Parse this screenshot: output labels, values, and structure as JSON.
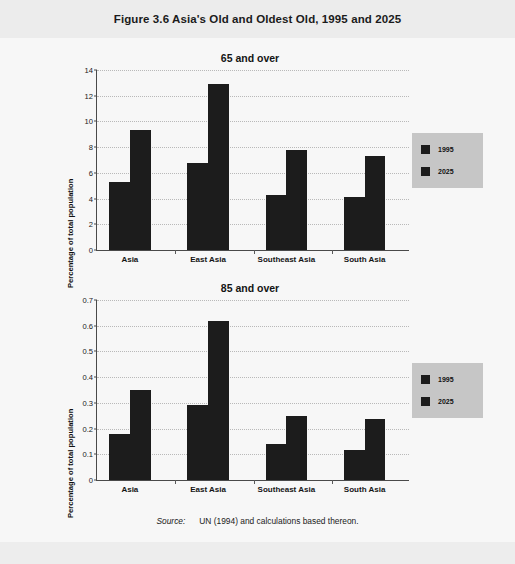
{
  "figure": {
    "title": "Figure 3.6  Asia's Old and Oldest Old, 1995 and 2025",
    "source_keyword": "Source:",
    "source_text": "UN (1994) and calculations based thereon."
  },
  "legend": {
    "series": [
      {
        "label": "1995",
        "color": "#1c1c1c"
      },
      {
        "label": "2025",
        "color": "#1c1c1c"
      }
    ],
    "background": "#c6c6c6"
  },
  "chart_data": [
    {
      "type": "bar",
      "title": "65 and over",
      "xlabel": "",
      "ylabel": "Percentage of total population",
      "categories": [
        "Asia",
        "East Asia",
        "Southeast Asia",
        "South Asia"
      ],
      "series": [
        {
          "name": "1995",
          "values": [
            5.3,
            6.8,
            4.25,
            4.15
          ]
        },
        {
          "name": "2025",
          "values": [
            9.3,
            12.95,
            7.8,
            7.35
          ]
        }
      ],
      "ylim": [
        0,
        14
      ],
      "yticks": [
        0,
        2,
        4,
        6,
        8,
        10,
        12,
        14
      ],
      "ytick_labels": [
        "0",
        "2",
        "4",
        "6",
        "8",
        "10",
        "12",
        "14"
      ],
      "grid": true,
      "legend_position": "right"
    },
    {
      "type": "bar",
      "title": "85 and over",
      "xlabel": "",
      "ylabel": "Percentage of total population",
      "categories": [
        "Asia",
        "East Asia",
        "Southeast Asia",
        "South Asia"
      ],
      "series": [
        {
          "name": "1995",
          "values": [
            0.18,
            0.29,
            0.14,
            0.115
          ]
        },
        {
          "name": "2025",
          "values": [
            0.35,
            0.62,
            0.25,
            0.237
          ]
        }
      ],
      "ylim": [
        0,
        0.7
      ],
      "yticks": [
        0,
        0.1,
        0.2,
        0.3,
        0.4,
        0.5,
        0.6,
        0.7
      ],
      "ytick_labels": [
        "0",
        "0.1",
        "0.2",
        "0.3",
        "0.4",
        "0.5",
        "0.6",
        "0.7"
      ],
      "grid": true,
      "legend_position": "right"
    }
  ]
}
